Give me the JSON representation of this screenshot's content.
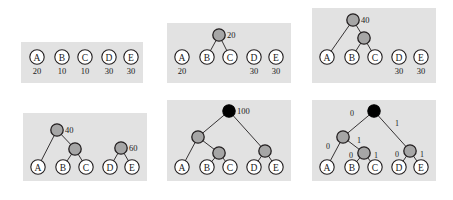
{
  "figure": {
    "colors": {
      "panel_background": "#e2e2e2",
      "page_background": "#ffffff",
      "leaf_fill": "#ffffff",
      "internal_fill": "#a6a6a6",
      "root_fill": "#000000",
      "stroke": "#231f20"
    }
  },
  "panels": [
    {
      "id": "panel-1",
      "step": 1,
      "x": 21,
      "y": 42,
      "w": 122,
      "h": 41,
      "leaves": [
        {
          "label": "A",
          "weight": "20",
          "cx": 16,
          "cy": 15
        },
        {
          "label": "B",
          "weight": "10",
          "cx": 41,
          "cy": 15
        },
        {
          "label": "C",
          "weight": "10",
          "cx": 64,
          "cy": 15
        },
        {
          "label": "D",
          "weight": "30",
          "cx": 88,
          "cy": 15
        },
        {
          "label": "E",
          "weight": "30",
          "cx": 110,
          "cy": 15
        }
      ],
      "internals": [],
      "edges": [],
      "bits": []
    },
    {
      "id": "panel-2",
      "step": 2,
      "x": 167,
      "y": 23,
      "w": 124,
      "h": 60,
      "leaves": [
        {
          "label": "A",
          "weight": "20",
          "cx": 15,
          "cy": 34
        },
        {
          "label": "B",
          "weight": "",
          "cx": 40,
          "cy": 34
        },
        {
          "label": "C",
          "weight": "",
          "cx": 63,
          "cy": 34
        },
        {
          "label": "D",
          "weight": "30",
          "cx": 87,
          "cy": 34
        },
        {
          "label": "E",
          "weight": "30",
          "cx": 109,
          "cy": 34
        }
      ],
      "internals": [
        {
          "value": "20",
          "cx": 52,
          "cy": 12,
          "kind": "gray"
        }
      ],
      "edges": [
        {
          "x1": 52,
          "y1": 12,
          "x2": 40,
          "y2": 34
        },
        {
          "x1": 52,
          "y1": 12,
          "x2": 63,
          "y2": 34
        }
      ],
      "bits": []
    },
    {
      "id": "panel-3",
      "step": 3,
      "x": 312,
      "y": 8,
      "w": 124,
      "h": 75,
      "leaves": [
        {
          "label": "A",
          "weight": "",
          "cx": 15,
          "cy": 49
        },
        {
          "label": "B",
          "weight": "",
          "cx": 40,
          "cy": 49
        },
        {
          "label": "C",
          "weight": "",
          "cx": 63,
          "cy": 49
        },
        {
          "label": "D",
          "weight": "30",
          "cx": 87,
          "cy": 49
        },
        {
          "label": "E",
          "weight": "30",
          "cx": 109,
          "cy": 49
        }
      ],
      "internals": [
        {
          "value": "40",
          "cx": 41,
          "cy": 12,
          "kind": "gray"
        },
        {
          "value": "",
          "cx": 52,
          "cy": 30,
          "kind": "gray"
        }
      ],
      "edges": [
        {
          "x1": 41,
          "y1": 12,
          "x2": 15,
          "y2": 49
        },
        {
          "x1": 41,
          "y1": 12,
          "x2": 52,
          "y2": 30
        },
        {
          "x1": 52,
          "y1": 30,
          "x2": 40,
          "y2": 49
        },
        {
          "x1": 52,
          "y1": 30,
          "x2": 63,
          "y2": 49
        }
      ],
      "bits": []
    },
    {
      "id": "panel-4",
      "step": 4,
      "x": 23,
      "y": 113,
      "w": 124,
      "h": 68,
      "leaves": [
        {
          "label": "A",
          "weight": "",
          "cx": 15,
          "cy": 54
        },
        {
          "label": "B",
          "weight": "",
          "cx": 40,
          "cy": 54
        },
        {
          "label": "C",
          "weight": "",
          "cx": 63,
          "cy": 54
        },
        {
          "label": "D",
          "weight": "",
          "cx": 87,
          "cy": 54
        },
        {
          "label": "E",
          "weight": "",
          "cx": 109,
          "cy": 54
        }
      ],
      "internals": [
        {
          "value": "40",
          "cx": 34,
          "cy": 17,
          "kind": "gray"
        },
        {
          "value": "",
          "cx": 52,
          "cy": 36,
          "kind": "gray"
        },
        {
          "value": "60",
          "cx": 98,
          "cy": 35,
          "kind": "gray"
        }
      ],
      "edges": [
        {
          "x1": 34,
          "y1": 17,
          "x2": 15,
          "y2": 54
        },
        {
          "x1": 34,
          "y1": 17,
          "x2": 52,
          "y2": 36
        },
        {
          "x1": 52,
          "y1": 36,
          "x2": 40,
          "y2": 54
        },
        {
          "x1": 52,
          "y1": 36,
          "x2": 63,
          "y2": 54
        },
        {
          "x1": 98,
          "y1": 35,
          "x2": 87,
          "y2": 54
        },
        {
          "x1": 98,
          "y1": 35,
          "x2": 109,
          "y2": 54
        }
      ],
      "bits": []
    },
    {
      "id": "panel-5",
      "step": 5,
      "x": 167,
      "y": 100,
      "w": 124,
      "h": 81,
      "leaves": [
        {
          "label": "A",
          "weight": "",
          "cx": 15,
          "cy": 67
        },
        {
          "label": "B",
          "weight": "",
          "cx": 40,
          "cy": 67
        },
        {
          "label": "C",
          "weight": "",
          "cx": 63,
          "cy": 67
        },
        {
          "label": "D",
          "weight": "",
          "cx": 87,
          "cy": 67
        },
        {
          "label": "E",
          "weight": "",
          "cx": 109,
          "cy": 67
        }
      ],
      "internals": [
        {
          "value": "100",
          "cx": 62,
          "cy": 11,
          "kind": "black"
        },
        {
          "value": "",
          "cx": 31,
          "cy": 37,
          "kind": "gray"
        },
        {
          "value": "",
          "cx": 52,
          "cy": 53,
          "kind": "gray"
        },
        {
          "value": "",
          "cx": 98,
          "cy": 51,
          "kind": "gray"
        }
      ],
      "edges": [
        {
          "x1": 62,
          "y1": 11,
          "x2": 31,
          "y2": 37
        },
        {
          "x1": 62,
          "y1": 11,
          "x2": 98,
          "y2": 51
        },
        {
          "x1": 31,
          "y1": 37,
          "x2": 15,
          "y2": 67
        },
        {
          "x1": 31,
          "y1": 37,
          "x2": 52,
          "y2": 53
        },
        {
          "x1": 52,
          "y1": 53,
          "x2": 40,
          "y2": 67
        },
        {
          "x1": 52,
          "y1": 53,
          "x2": 63,
          "y2": 67
        },
        {
          "x1": 98,
          "y1": 51,
          "x2": 87,
          "y2": 67
        },
        {
          "x1": 98,
          "y1": 51,
          "x2": 109,
          "y2": 67
        }
      ],
      "bits": []
    },
    {
      "id": "panel-6",
      "step": 6,
      "x": 312,
      "y": 100,
      "w": 124,
      "h": 81,
      "leaves": [
        {
          "label": "A",
          "weight": "",
          "cx": 15,
          "cy": 67
        },
        {
          "label": "B",
          "weight": "",
          "cx": 40,
          "cy": 67
        },
        {
          "label": "C",
          "weight": "",
          "cx": 63,
          "cy": 67
        },
        {
          "label": "D",
          "weight": "",
          "cx": 87,
          "cy": 67
        },
        {
          "label": "E",
          "weight": "",
          "cx": 109,
          "cy": 67
        }
      ],
      "internals": [
        {
          "value": "",
          "cx": 62,
          "cy": 11,
          "kind": "black"
        },
        {
          "value": "",
          "cx": 31,
          "cy": 37,
          "kind": "gray"
        },
        {
          "value": "",
          "cx": 52,
          "cy": 53,
          "kind": "gray"
        },
        {
          "value": "",
          "cx": 98,
          "cy": 51,
          "kind": "gray"
        }
      ],
      "edges": [
        {
          "x1": 62,
          "y1": 11,
          "x2": 31,
          "y2": 37
        },
        {
          "x1": 62,
          "y1": 11,
          "x2": 98,
          "y2": 51
        },
        {
          "x1": 31,
          "y1": 37,
          "x2": 15,
          "y2": 67
        },
        {
          "x1": 31,
          "y1": 37,
          "x2": 52,
          "y2": 53
        },
        {
          "x1": 52,
          "y1": 53,
          "x2": 40,
          "y2": 67
        },
        {
          "x1": 52,
          "y1": 53,
          "x2": 63,
          "y2": 67
        },
        {
          "x1": 98,
          "y1": 51,
          "x2": 87,
          "y2": 67
        },
        {
          "x1": 98,
          "y1": 51,
          "x2": 109,
          "y2": 67
        }
      ],
      "bits": [
        {
          "text": "0",
          "x": 40,
          "y": 16
        },
        {
          "text": "1",
          "x": 85,
          "y": 26
        },
        {
          "text": "0",
          "x": 16,
          "y": 49
        },
        {
          "text": "1",
          "x": 47,
          "y": 43
        },
        {
          "text": "0",
          "x": 39,
          "y": 58
        },
        {
          "text": "1",
          "x": 64,
          "y": 58
        },
        {
          "text": "0",
          "x": 85,
          "y": 57
        },
        {
          "text": "1",
          "x": 110,
          "y": 57
        }
      ]
    }
  ],
  "chart_data": {
    "type": "diagram",
    "symbols": [
      "A",
      "B",
      "C",
      "D",
      "E"
    ],
    "frequencies": [
      20,
      10,
      10,
      30,
      30
    ],
    "merge_steps": [
      {
        "step": 1,
        "merged": [],
        "new_node_value": null,
        "note": "Initial leaves A=20 B=10 C=10 D=30 E=30"
      },
      {
        "step": 2,
        "merged": [
          "B",
          "C"
        ],
        "new_node_value": 20,
        "note": "Merge B(10)+C(10) -> 20"
      },
      {
        "step": 3,
        "merged": [
          "A",
          "BC"
        ],
        "new_node_value": 40,
        "note": "Merge A(20)+BC(20) -> 40"
      },
      {
        "step": 4,
        "merged": [
          "D",
          "E"
        ],
        "new_node_value": 60,
        "note": "Merge D(30)+E(30) -> 60"
      },
      {
        "step": 5,
        "merged": [
          "ABC",
          "DE"
        ],
        "new_node_value": 100,
        "note": "Merge 40+60 -> 100 root"
      },
      {
        "step": 6,
        "merged": [],
        "new_node_value": null,
        "note": "Label edges with bits 0 (left) and 1 (right)"
      }
    ],
    "codes": [
      {
        "symbol": "A",
        "code": "00"
      },
      {
        "symbol": "B",
        "code": "010"
      },
      {
        "symbol": "C",
        "code": "011"
      },
      {
        "symbol": "D",
        "code": "10"
      },
      {
        "symbol": "E",
        "code": "11"
      }
    ]
  }
}
